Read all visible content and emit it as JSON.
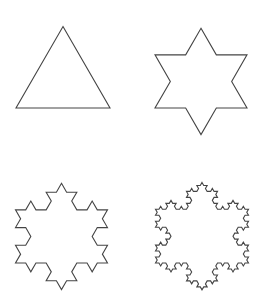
{
  "diagram": {
    "stroke_color": "#444444",
    "background": "#ffffff",
    "panels": [
      {
        "name": "iteration-0",
        "iterations": 0,
        "center_x": 63,
        "base_y": 108,
        "side": 94
      },
      {
        "name": "iteration-1",
        "iterations": 1,
        "center_x": 201,
        "base_y": 108,
        "side": 92
      },
      {
        "name": "iteration-2",
        "iterations": 2,
        "center_x": 61.5,
        "base_y": 263,
        "side": 92
      },
      {
        "name": "iteration-3",
        "iterations": 3,
        "center_x": 202,
        "base_y": 263,
        "side": 93
      }
    ]
  }
}
